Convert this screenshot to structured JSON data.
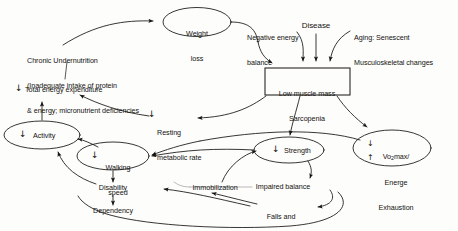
{
  "diagram": {
    "type": "flow-diagram",
    "style": "hand-drawn scanned figure, black line art on white",
    "colors": {
      "ink": "#14130f",
      "background": "#fdfdfc",
      "box_stroke": "#14130f"
    },
    "nodes": [
      {
        "id": "weight-loss",
        "shape": "ellipse",
        "label": "Weight\nloss",
        "line1": "Weight",
        "line2": "loss",
        "x": 197,
        "y": 22
      },
      {
        "id": "chronic-undernutrition",
        "shape": "text",
        "label": "Chronic Undernutrition\n(Inadequate intake of protein\n& energy; micronutrient deficiencies",
        "line1": "Chronic Undernutrition",
        "line2": "(Inadequate intake of protein",
        "line3": "& energy; micronutrient deficiencies",
        "x": 27,
        "y": 43
      },
      {
        "id": "negative-energy-balance",
        "shape": "text",
        "label": "Negative energy\nbalance",
        "line1": "Negative energy",
        "line2": "balance",
        "x": 247,
        "y": 22
      },
      {
        "id": "disease",
        "shape": "text",
        "label": "Disease",
        "x": 316,
        "y": 25
      },
      {
        "id": "aging",
        "shape": "text",
        "label": "Aging: Senescent\nMusculoskeletal changes",
        "line1": "Aging: Senescent",
        "line2": "Musculoskeletal changes",
        "x": 354,
        "y": 21
      },
      {
        "id": "low-muscle-mass",
        "shape": "rectangle",
        "label": "Low muscle mass\nSarcopenia",
        "line1": "Low muscle mass",
        "line2": "Sarcopenia",
        "x": 307,
        "y": 82
      },
      {
        "id": "total-energy-expenditure",
        "shape": "text-with-down-arrow",
        "label": "Total energy expenditure",
        "arrow": "down",
        "x": 30,
        "y": 89
      },
      {
        "id": "resting-metabolic-rate",
        "shape": "text-with-down-arrow",
        "label": "Resting\nmetabolic rate",
        "line1": "Resting",
        "line2": "metabolic rate",
        "arrow": "down",
        "x": 155,
        "y": 114
      },
      {
        "id": "activity",
        "shape": "ellipse",
        "label": "Activity",
        "arrow": "down",
        "x": 42,
        "y": 135
      },
      {
        "id": "walking-speed",
        "shape": "ellipse",
        "label": "Walking\nspeed",
        "line1": "Walking",
        "line2": "speed",
        "arrow": "down",
        "x": 113,
        "y": 155
      },
      {
        "id": "strength",
        "shape": "ellipse",
        "label": "Strength",
        "arrow": "down",
        "x": 289,
        "y": 150
      },
      {
        "id": "vo2max-exhaustion",
        "shape": "ellipse",
        "label": "Vo2max/\nEnerge\nExhaustion",
        "line1": "Vo",
        "line1_sub": "2",
        "line1_rest": "max/",
        "line2": "Energe",
        "line3": "Exhaustion",
        "arrow_down": "down",
        "arrow_up": "up",
        "x": 392,
        "y": 148
      },
      {
        "id": "impaired-balance",
        "shape": "text",
        "label": "Impaired balance",
        "x": 283,
        "y": 186
      },
      {
        "id": "disability",
        "shape": "text",
        "label": "Disability",
        "x": 96,
        "y": 189
      },
      {
        "id": "dependency",
        "shape": "text",
        "label": "Dependency",
        "x": 92,
        "y": 212
      },
      {
        "id": "immobilization",
        "shape": "text",
        "label": "Immobilization",
        "x": 215,
        "y": 188
      },
      {
        "id": "falls-and-injuries",
        "shape": "text",
        "label": "Falls and\ninjuries",
        "line1": "Falls and",
        "line2": "injuries",
        "x": 265,
        "y": 201
      }
    ],
    "edges": [
      {
        "from": "chronic-undernutrition",
        "to": "weight-loss",
        "style": "curve"
      },
      {
        "from": "weight-loss",
        "to": "low-muscle-mass",
        "style": "curve"
      },
      {
        "from": "negative-energy-balance",
        "to": "low-muscle-mass",
        "style": "curve"
      },
      {
        "from": "disease",
        "to": "low-muscle-mass",
        "style": "straight"
      },
      {
        "from": "aging",
        "to": "low-muscle-mass",
        "style": "curve"
      },
      {
        "from": "chronic-undernutrition",
        "to": "total-energy-expenditure",
        "style": "line"
      },
      {
        "from": "low-muscle-mass",
        "to": "resting-metabolic-rate",
        "style": "curve"
      },
      {
        "from": "resting-metabolic-rate",
        "to": "total-energy-expenditure",
        "style": "curve"
      },
      {
        "from": "activity",
        "to": "total-energy-expenditure",
        "style": "arrow-up"
      },
      {
        "from": "low-muscle-mass",
        "to": "strength",
        "style": "curve"
      },
      {
        "from": "low-muscle-mass",
        "to": "vo2max-exhaustion",
        "style": "curve"
      },
      {
        "from": "vo2max-exhaustion",
        "to": "walking-speed",
        "style": "curve"
      },
      {
        "from": "walking-speed",
        "to": "activity",
        "style": "curve"
      },
      {
        "from": "walking-speed",
        "to": "disability",
        "style": "arrow-down"
      },
      {
        "from": "strength",
        "to": "walking-speed",
        "style": "curve"
      },
      {
        "from": "strength",
        "to": "impaired-balance",
        "style": "curve"
      },
      {
        "from": "impaired-balance",
        "to": "falls-and-injuries",
        "style": "curve"
      },
      {
        "from": "falls-and-injuries",
        "to": "immobilization",
        "style": "curve"
      },
      {
        "from": "immobilization",
        "to": "strength",
        "style": "curve"
      },
      {
        "from": "immobilization",
        "to": "disability",
        "style": "line"
      },
      {
        "from": "falls-and-injuries",
        "to": "disability",
        "style": "curve"
      },
      {
        "from": "disability",
        "to": "dependency",
        "style": "arrow-down"
      },
      {
        "from": "disability",
        "to": "activity",
        "style": "curve"
      }
    ]
  }
}
